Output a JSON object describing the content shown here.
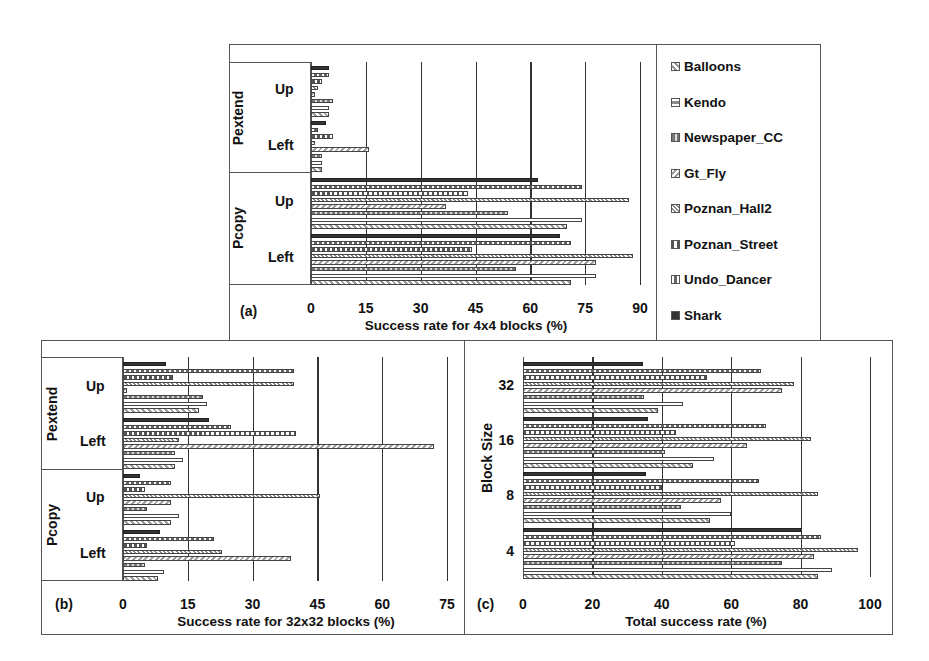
{
  "series_order_top_to_bottom": [
    "Shark",
    "Undo_Dancer",
    "Poznan_Street",
    "Poznan_Hall2",
    "Gt_Fly",
    "Newspaper_CC",
    "Kendo",
    "Balloons"
  ],
  "legend": {
    "items": [
      {
        "name": "Balloons",
        "pattern": "diag-light",
        "color": "#9a9a9a"
      },
      {
        "name": "Kendo",
        "pattern": "hlines",
        "color": "#8a8a8a"
      },
      {
        "name": "Newspaper_CC",
        "pattern": "checker",
        "color": "#777777"
      },
      {
        "name": "Gt_Fly",
        "pattern": "diag-back",
        "color": "#a0a0a0"
      },
      {
        "name": "Poznan_Hall2",
        "pattern": "diag-fine",
        "color": "#888888"
      },
      {
        "name": "Poznan_Street",
        "pattern": "triangles",
        "color": "#555555"
      },
      {
        "name": "Undo_Dancer",
        "pattern": "dash",
        "color": "#666666"
      },
      {
        "name": "Shark",
        "pattern": "solid",
        "color": "#333333"
      }
    ]
  },
  "panels": {
    "a": {
      "tag": "(a)",
      "xlabel": "Success rate for 4x4 blocks (%)",
      "ticks": [
        "0",
        "15",
        "30",
        "45",
        "60",
        "75",
        "90"
      ]
    },
    "b": {
      "tag": "(b)",
      "xlabel": "Success rate for 32x32 blocks (%)",
      "ticks": [
        "0",
        "15",
        "30",
        "45",
        "60",
        "75"
      ]
    },
    "c": {
      "tag": "(c)",
      "xlabel": "Total success rate (%)",
      "ylabel": "Block Size",
      "ticks": [
        "0",
        "20",
        "40",
        "60",
        "80",
        "100"
      ]
    }
  },
  "group_labels": {
    "pextend": "Pextend",
    "pcopy": "Pcopy",
    "up": "Up",
    "left": "Left"
  },
  "block_labels": {
    "b32": "32",
    "b16": "16",
    "b8": "8",
    "b4": "4"
  },
  "chart_data": [
    {
      "type": "bar",
      "orientation": "horizontal",
      "title": "(a)",
      "xlabel": "Success rate for 4x4 blocks (%)",
      "ylabel": "",
      "xlim": [
        0,
        90
      ],
      "grid": true,
      "legend_position": "right",
      "categories": [
        "Pextend Up",
        "Pextend Left",
        "Pcopy Up",
        "Pcopy Left"
      ],
      "series": [
        {
          "name": "Shark",
          "values": [
            5,
            4,
            62,
            68
          ]
        },
        {
          "name": "Undo_Dancer",
          "values": [
            5,
            2,
            74,
            71
          ]
        },
        {
          "name": "Poznan_Street",
          "values": [
            3,
            6,
            43,
            44
          ]
        },
        {
          "name": "Poznan_Hall2",
          "values": [
            2,
            1,
            87,
            88
          ]
        },
        {
          "name": "Gt_Fly",
          "values": [
            1,
            16,
            37,
            78
          ]
        },
        {
          "name": "Newspaper_CC",
          "values": [
            6,
            3,
            54,
            56
          ]
        },
        {
          "name": "Kendo",
          "values": [
            5,
            3,
            74,
            78
          ]
        },
        {
          "name": "Balloons",
          "values": [
            5,
            3,
            70,
            71
          ]
        }
      ]
    },
    {
      "type": "bar",
      "orientation": "horizontal",
      "title": "(b)",
      "xlabel": "Success rate for 32x32 blocks (%)",
      "ylabel": "",
      "xlim": [
        0,
        75
      ],
      "grid": true,
      "categories": [
        "Pextend Up",
        "Pextend Left",
        "Pcopy Up",
        "Pcopy Left"
      ],
      "series": [
        {
          "name": "Shark",
          "values": [
            10,
            20,
            4,
            8.5
          ]
        },
        {
          "name": "Undo_Dancer",
          "values": [
            39.5,
            25,
            11,
            21
          ]
        },
        {
          "name": "Poznan_Street",
          "values": [
            11.5,
            40,
            5,
            5.5
          ]
        },
        {
          "name": "Poznan_Hall2",
          "values": [
            39.5,
            13,
            45.5,
            23
          ]
        },
        {
          "name": "Gt_Fly",
          "values": [
            1,
            72,
            11,
            39
          ]
        },
        {
          "name": "Newspaper_CC",
          "values": [
            18.5,
            12,
            5.5,
            5
          ]
        },
        {
          "name": "Kendo",
          "values": [
            19.5,
            14,
            13,
            9.5
          ]
        },
        {
          "name": "Balloons",
          "values": [
            17.5,
            12,
            11,
            8
          ]
        }
      ]
    },
    {
      "type": "bar",
      "orientation": "horizontal",
      "title": "(c)",
      "xlabel": "Total success rate (%)",
      "ylabel": "Block Size",
      "xlim": [
        0,
        100
      ],
      "grid": true,
      "categories": [
        "32",
        "16",
        "8",
        "4"
      ],
      "series": [
        {
          "name": "Shark",
          "values": [
            34.5,
            36,
            35.5,
            80
          ]
        },
        {
          "name": "Undo_Dancer",
          "values": [
            68.5,
            70,
            68,
            86
          ]
        },
        {
          "name": "Poznan_Street",
          "values": [
            53,
            44,
            40,
            61
          ]
        },
        {
          "name": "Poznan_Hall2",
          "values": [
            78,
            83,
            85,
            96.5
          ]
        },
        {
          "name": "Gt_Fly",
          "values": [
            74.5,
            64.5,
            57,
            84
          ]
        },
        {
          "name": "Newspaper_CC",
          "values": [
            35,
            41,
            45.5,
            74.5
          ]
        },
        {
          "name": "Kendo",
          "values": [
            46,
            55,
            60,
            89
          ]
        },
        {
          "name": "Balloons",
          "values": [
            39,
            49,
            54,
            85
          ]
        }
      ]
    }
  ]
}
